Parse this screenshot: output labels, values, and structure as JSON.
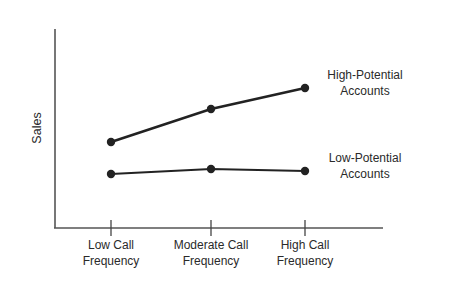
{
  "chart_data": {
    "type": "line",
    "title": "",
    "xlabel": "",
    "ylabel": "Sales",
    "categories": [
      [
        "Low Call",
        "Frequency"
      ],
      [
        "Moderate Call",
        "Frequency"
      ],
      [
        "High Call",
        "Frequency"
      ]
    ],
    "series": [
      {
        "name": "High-Potential Accounts",
        "label_lines": [
          "High-Potential",
          "Accounts"
        ],
        "values": [
          86,
          119,
          140
        ],
        "stroke_width": 2.6,
        "color": "#222222"
      },
      {
        "name": "Low-Potential Accounts",
        "label_lines": [
          "Low-Potential",
          "Accounts"
        ],
        "values": [
          54,
          59,
          57
        ],
        "stroke_width": 1.8,
        "color": "#222222"
      }
    ],
    "ylim": [
      0,
      200
    ],
    "grid": false,
    "legend_position": "inline-right",
    "y_ticks_shown": false
  }
}
